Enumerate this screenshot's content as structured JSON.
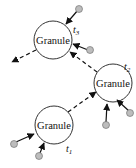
{
  "diagram": {
    "nodes": [
      {
        "id": "g3",
        "label": "Granule",
        "time_label": "t",
        "time_index": "3"
      },
      {
        "id": "g2",
        "label": "Granule",
        "time_label": "t",
        "time_index": "2"
      },
      {
        "id": "g1",
        "label": "Granule",
        "time_label": "t",
        "time_index": "1"
      }
    ],
    "edges": [
      {
        "from": "g1",
        "to": "g2",
        "style": "dashed"
      },
      {
        "from": "g2",
        "to": "g3",
        "style": "dashed"
      },
      {
        "from": "g3",
        "to": "out",
        "style": "dashed"
      }
    ],
    "inputs_per_granule": 2,
    "colors": {
      "stroke": "#222222",
      "dot_fill": "#bdbdbd",
      "circle_fill": "#ffffff"
    }
  }
}
